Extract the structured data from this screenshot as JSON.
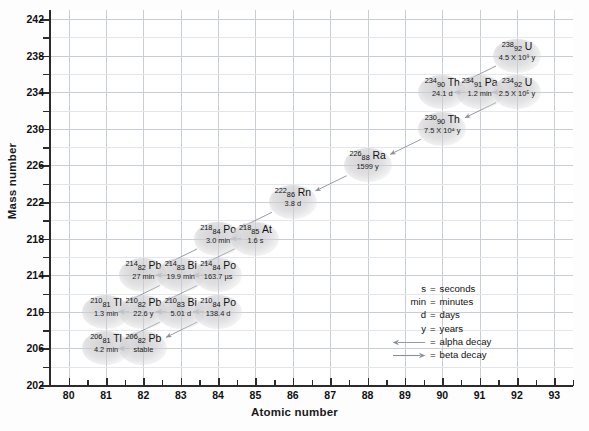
{
  "chart_data": {
    "type": "scatter",
    "title": "",
    "xlabel": "Atomic number",
    "ylabel": "Mass number",
    "xlim": [
      79.5,
      93.5
    ],
    "ylim": [
      202,
      243
    ],
    "xticks": [
      80,
      81,
      82,
      83,
      84,
      85,
      86,
      87,
      88,
      89,
      90,
      91,
      92,
      93
    ],
    "yticks": [
      202,
      206,
      210,
      214,
      218,
      222,
      226,
      230,
      234,
      238,
      242
    ],
    "grid": true,
    "legend_position": "inside-lower-right",
    "nuclides": [
      {
        "mass": "238",
        "z": "92",
        "element": "U",
        "half_life": "4.5 X 10⁹ y",
        "x": 92,
        "y": 238
      },
      {
        "mass": "234",
        "z": "90",
        "element": "Th",
        "half_life": "24.1 d",
        "x": 90,
        "y": 234
      },
      {
        "mass": "234",
        "z": "91",
        "element": "Pa",
        "half_life": "1.2 min",
        "x": 91,
        "y": 234
      },
      {
        "mass": "234",
        "z": "92",
        "element": "U",
        "half_life": "2.5 X 10⁵ y",
        "x": 92,
        "y": 234
      },
      {
        "mass": "230",
        "z": "90",
        "element": "Th",
        "half_life": "7.5 X 10⁴ y",
        "x": 90,
        "y": 230
      },
      {
        "mass": "226",
        "z": "88",
        "element": "Ra",
        "half_life": "1599 y",
        "x": 88,
        "y": 226
      },
      {
        "mass": "222",
        "z": "86",
        "element": "Rn",
        "half_life": "3.8 d",
        "x": 86,
        "y": 222
      },
      {
        "mass": "218",
        "z": "84",
        "element": "Po",
        "half_life": "3.0 min",
        "x": 84,
        "y": 218
      },
      {
        "mass": "218",
        "z": "85",
        "element": "At",
        "half_life": "1.6 s",
        "x": 85,
        "y": 218
      },
      {
        "mass": "214",
        "z": "82",
        "element": "Pb",
        "half_life": "27 min",
        "x": 82,
        "y": 214
      },
      {
        "mass": "214",
        "z": "83",
        "element": "Bi",
        "half_life": "19.9 min",
        "x": 83,
        "y": 214
      },
      {
        "mass": "214",
        "z": "84",
        "element": "Po",
        "half_life": "163.7 µs",
        "x": 84,
        "y": 214
      },
      {
        "mass": "210",
        "z": "81",
        "element": "Tl",
        "half_life": "1.3 min",
        "x": 81,
        "y": 210
      },
      {
        "mass": "210",
        "z": "82",
        "element": "Pb",
        "half_life": "22.6 y",
        "x": 82,
        "y": 210
      },
      {
        "mass": "210",
        "z": "83",
        "element": "Bi",
        "half_life": "5.01 d",
        "x": 83,
        "y": 210
      },
      {
        "mass": "210",
        "z": "84",
        "element": "Po",
        "half_life": "138.4 d",
        "x": 84,
        "y": 210
      },
      {
        "mass": "206",
        "z": "81",
        "element": "Tl",
        "half_life": "4.2 min",
        "x": 81,
        "y": 206
      },
      {
        "mass": "206",
        "z": "82",
        "element": "Pb",
        "half_life": "stable",
        "x": 82,
        "y": 206
      }
    ],
    "decays": [
      {
        "from": [
          92,
          238
        ],
        "to": [
          90,
          234
        ],
        "type": "alpha"
      },
      {
        "from": [
          90,
          234
        ],
        "to": [
          91,
          234
        ],
        "type": "beta"
      },
      {
        "from": [
          91,
          234
        ],
        "to": [
          92,
          234
        ],
        "type": "beta"
      },
      {
        "from": [
          92,
          234
        ],
        "to": [
          90,
          230
        ],
        "type": "alpha"
      },
      {
        "from": [
          90,
          230
        ],
        "to": [
          88,
          226
        ],
        "type": "alpha"
      },
      {
        "from": [
          88,
          226
        ],
        "to": [
          86,
          222
        ],
        "type": "alpha"
      },
      {
        "from": [
          86,
          222
        ],
        "to": [
          84,
          218
        ],
        "type": "alpha"
      },
      {
        "from": [
          84,
          218
        ],
        "to": [
          85,
          218
        ],
        "type": "beta"
      },
      {
        "from": [
          84,
          218
        ],
        "to": [
          82,
          214
        ],
        "type": "alpha"
      },
      {
        "from": [
          85,
          218
        ],
        "to": [
          83,
          214
        ],
        "type": "alpha"
      },
      {
        "from": [
          82,
          214
        ],
        "to": [
          83,
          214
        ],
        "type": "beta"
      },
      {
        "from": [
          83,
          214
        ],
        "to": [
          84,
          214
        ],
        "type": "beta"
      },
      {
        "from": [
          83,
          214
        ],
        "to": [
          81,
          210
        ],
        "type": "alpha"
      },
      {
        "from": [
          84,
          214
        ],
        "to": [
          82,
          210
        ],
        "type": "alpha"
      },
      {
        "from": [
          81,
          210
        ],
        "to": [
          82,
          210
        ],
        "type": "beta"
      },
      {
        "from": [
          82,
          210
        ],
        "to": [
          83,
          210
        ],
        "type": "beta"
      },
      {
        "from": [
          83,
          210
        ],
        "to": [
          84,
          210
        ],
        "type": "beta"
      },
      {
        "from": [
          83,
          210
        ],
        "to": [
          81,
          206
        ],
        "type": "alpha"
      },
      {
        "from": [
          84,
          210
        ],
        "to": [
          82,
          206
        ],
        "type": "alpha"
      },
      {
        "from": [
          81,
          206
        ],
        "to": [
          82,
          206
        ],
        "type": "beta"
      }
    ]
  },
  "axes": {
    "x_title": "Atomic number",
    "y_title": "Mass number"
  },
  "legend": {
    "rows": [
      {
        "key": "s",
        "eq": "=",
        "value": "seconds",
        "icon": null
      },
      {
        "key": "min",
        "eq": "=",
        "value": "minutes",
        "icon": null
      },
      {
        "key": "d",
        "eq": "=",
        "value": "days",
        "icon": null
      },
      {
        "key": "y",
        "eq": "=",
        "value": "years",
        "icon": null
      },
      {
        "key": "",
        "eq": "=",
        "value": "alpha decay",
        "icon": "arrow-left-icon"
      },
      {
        "key": "",
        "eq": "=",
        "value": "beta decay",
        "icon": "arrow-right-icon"
      }
    ]
  },
  "colors": {
    "grid_major": "#c9cdd4",
    "grid_minor": "#e3e6ea",
    "axis": "#2b2b2b",
    "node_fill": "#cdcdd0",
    "arrow": "#8a8f98",
    "text": "#111111"
  }
}
